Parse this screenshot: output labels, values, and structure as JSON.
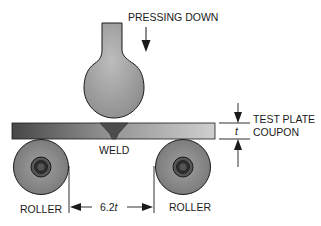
{
  "diagram": {
    "labels": {
      "pressing_down": "PRESSING DOWN",
      "test_plate": "TEST PLATE",
      "coupon": "COUPON",
      "thickness": "t",
      "weld": "WELD",
      "roller_left": "ROLLER",
      "roller_right": "ROLLER",
      "spacing_value": "6.2",
      "spacing_unit": "t"
    },
    "components": [
      {
        "name": "plunger",
        "shape": "bulb on stem",
        "color": "#a9a9a9"
      },
      {
        "name": "test-plate-coupon",
        "shape": "rectangle with horizontal gradient",
        "color_left": "#4a4a4a",
        "color_right": "#c8c8c8"
      },
      {
        "name": "weld",
        "shape": "V-groove",
        "color": "#4d4d4d"
      },
      {
        "name": "roller-left",
        "shape": "circle with hub",
        "color": "#8a8a8a"
      },
      {
        "name": "roller-right",
        "shape": "circle with hub",
        "color": "#8a8a8a"
      }
    ],
    "dimensions": [
      {
        "label": "t",
        "meaning": "plate thickness"
      },
      {
        "label": "6.2t",
        "meaning": "roller spacing"
      }
    ],
    "colors": {
      "outline": "#1a1a1a",
      "plunger_fill": "#a9a9a9",
      "roller_fill": "#8c8c8c",
      "hub_dark": "#333333",
      "background": "#ffffff"
    }
  }
}
